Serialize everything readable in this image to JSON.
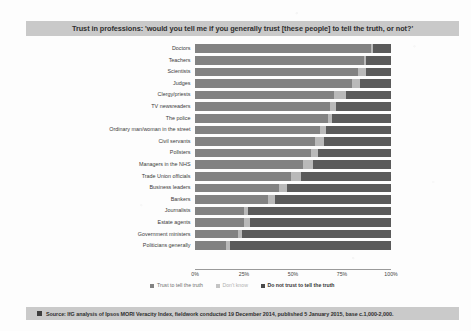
{
  "title": "Trust in professions: 'would you tell me if you generally trust [these people] to tell the truth, or not?'",
  "source": {
    "swatch_color": "#3e3e3e",
    "text": "Source: IfG analysis of Ipsos MORI Veracity Index, fieldwork conducted 19 December 2014, published 5 January 2015, base c.1,000-2,000."
  },
  "legend": {
    "items": [
      {
        "label": "Trust to tell the truth",
        "color": "#828282"
      },
      {
        "label": "Don't know",
        "color": "#c4c4c4"
      },
      {
        "label": "Do not trust to tell the truth",
        "color": "#4a4a4a"
      }
    ]
  },
  "axis": {
    "ticks": [
      {
        "label": "0%",
        "value": 0
      },
      {
        "label": "25%",
        "value": 25
      },
      {
        "label": "50%",
        "value": 50
      },
      {
        "label": "75%",
        "value": 75
      },
      {
        "label": "100%",
        "value": 100
      }
    ]
  },
  "chart_data": {
    "type": "bar",
    "orientation": "horizontal",
    "stacked": true,
    "percent": true,
    "title": "Trust in professions: 'would you tell me if you generally trust [these people] to tell the truth, or not?'",
    "xlabel": "",
    "ylabel": "",
    "xlim": [
      0,
      100
    ],
    "grid": false,
    "legend_position": "bottom",
    "categories": [
      "Doctors",
      "Teachers",
      "Scientists",
      "Judges",
      "Clergy/priests",
      "TV newsreaders",
      "The police",
      "Ordinary man/woman in the street",
      "Civil servants",
      "Pollsters",
      "Managers in the NHS",
      "Trade Union officials",
      "Business leaders",
      "Bankers",
      "Journalists",
      "Estate agents",
      "Government ministers",
      "Politicians generally"
    ],
    "series": [
      {
        "name": "Trust to tell the truth",
        "color": "#828282",
        "values": [
          90,
          86,
          83,
          80,
          71,
          69,
          68,
          64,
          61,
          59,
          55,
          49,
          43,
          37,
          25,
          25,
          22,
          16
        ]
      },
      {
        "name": "Don't know",
        "color": "#b9b9b9",
        "values": [
          1,
          1,
          4,
          4,
          6,
          3,
          2,
          3,
          5,
          4,
          5,
          5,
          4,
          4,
          2,
          3,
          2,
          2
        ]
      },
      {
        "name": "Do not trust to tell the truth",
        "color": "#5a5a5a",
        "values": [
          9,
          13,
          13,
          16,
          23,
          28,
          30,
          33,
          34,
          37,
          40,
          46,
          53,
          59,
          73,
          72,
          76,
          82
        ]
      }
    ],
    "source": "Source: IfG analysis of Ipsos MORI Veracity Index, fieldwork conducted 19 December 2014, published 5 January 2015, base c.1,000-2,000."
  }
}
